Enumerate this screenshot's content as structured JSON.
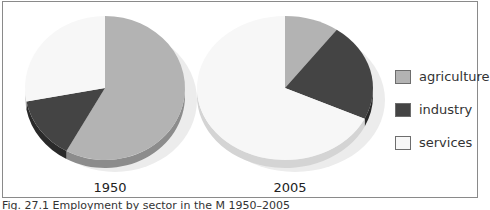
{
  "chart_data": {
    "type": "pie",
    "title": "",
    "caption": "Fig. 27.1 Employment by sector in the M… 1950–2005",
    "legend": {
      "position": "right",
      "entries": [
        {
          "label": "agriculture",
          "color": "#b3b3b3"
        },
        {
          "label": "industry",
          "color": "#444444"
        },
        {
          "label": "services",
          "color": "#f7f7f7"
        }
      ]
    },
    "categories": [
      "agriculture",
      "industry",
      "services"
    ],
    "series": [
      {
        "name": "1950",
        "values": [
          58,
          14,
          28
        ]
      },
      {
        "name": "2005",
        "values": [
          10,
          22,
          68
        ]
      }
    ],
    "units": "percent (estimated from slice angles)"
  },
  "labels": {
    "pie1_year": "1950",
    "pie2_year": "2005",
    "legend_agriculture": "agriculture",
    "legend_industry": "industry",
    "legend_services": "services",
    "caption": "Fig. 27.1 Employment by sector in the M          1950–2005"
  }
}
